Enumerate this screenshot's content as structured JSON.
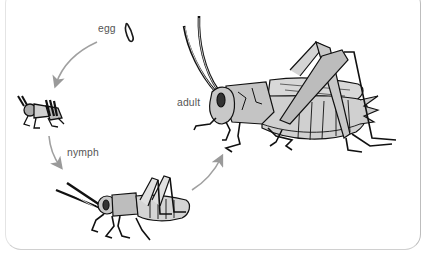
{
  "stages": [
    {
      "id": "egg",
      "label": "egg"
    },
    {
      "id": "hatchling",
      "label": ""
    },
    {
      "id": "nymph",
      "label": "nymph"
    },
    {
      "id": "adult",
      "label": "adult"
    }
  ],
  "arrows": [
    {
      "from": "egg",
      "to": "hatchling"
    },
    {
      "from": "hatchling",
      "to": "nymph"
    },
    {
      "from": "nymph",
      "to": "adult"
    }
  ],
  "colors": {
    "line": "#1a1a1a",
    "body_fill": "#c8c8c8",
    "body_light": "#e2e2e2",
    "arrow": "#9a9a9a",
    "label": "#555555",
    "frame": "#bdbdbd"
  }
}
